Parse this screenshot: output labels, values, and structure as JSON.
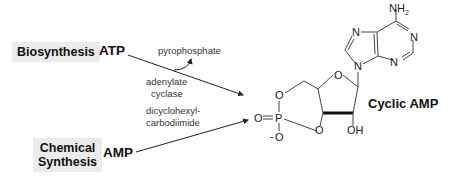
{
  "diagram": {
    "routes": [
      {
        "label": "Biosynthesis",
        "reactant": "ATP",
        "byproduct": "pyrophosphate",
        "reagent_line1": "adenylate",
        "reagent_line2": "cyclase"
      },
      {
        "label_line1": "Chemical",
        "label_line2": "Synthesis",
        "reactant": "AMP",
        "reagent_line1": "dicyclohexyl-",
        "reagent_line2": "carbodiimide"
      }
    ],
    "product": "Cyclic AMP",
    "structure_atoms": {
      "nh2": "NH",
      "nh2_sub": "2",
      "n": "N",
      "o": "O",
      "p": "P",
      "oh": "OH",
      "o_minus": "-O"
    }
  }
}
